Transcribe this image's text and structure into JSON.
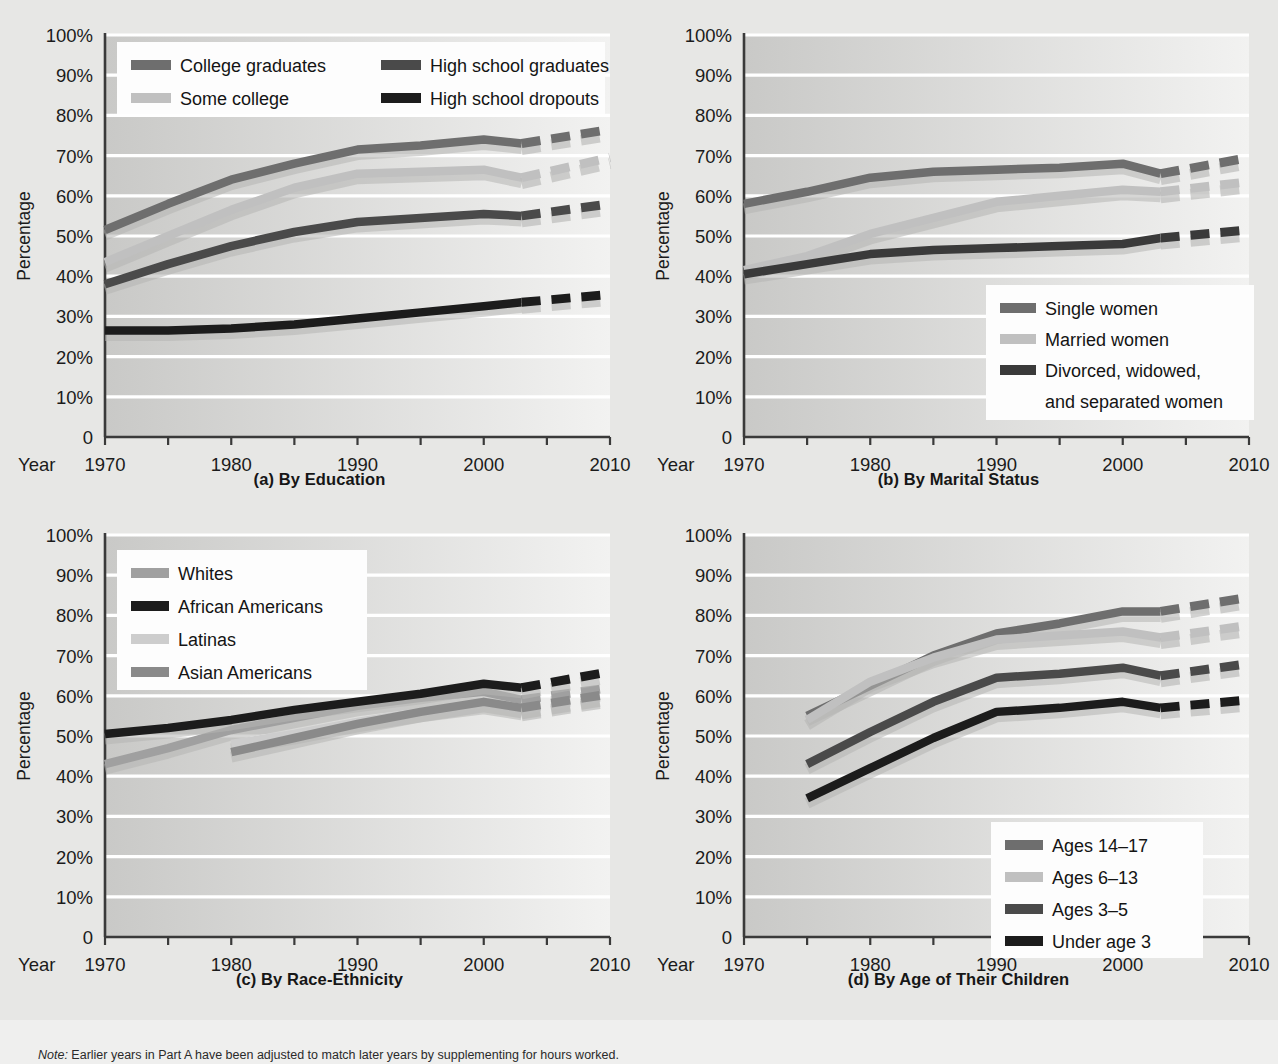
{
  "figure": {
    "note_prefix": "Note:",
    "note_text": " Earlier years in Part A have been adjusted to match later years by supplementing for hours worked.",
    "background_color": "#e7e7e5",
    "plot_fill_left": "#c9c9c7",
    "plot_fill_right": "#f2f2f1",
    "gridline_color": "#ffffff",
    "axis_color": "#3a3a3a"
  },
  "axes_common": {
    "ylabel": "Percentage",
    "year_label": "Year",
    "y_ticks": [
      "100%",
      "90%",
      "80%",
      "70%",
      "60%",
      "50%",
      "40%",
      "30%",
      "20%",
      "10%",
      "0"
    ],
    "y_values": [
      100,
      90,
      80,
      70,
      60,
      50,
      40,
      30,
      20,
      10,
      0
    ],
    "x_ticks": [
      "1970",
      "1980",
      "1990",
      "2000",
      "2010"
    ],
    "x_tick_values": [
      1970,
      1980,
      1990,
      2000,
      2010
    ],
    "x_minor_step": 5,
    "xlim": [
      1970,
      2010
    ],
    "ylim": [
      0,
      100
    ],
    "grid": true
  },
  "series_colors": {
    "dark_gray": "#6e6e6e",
    "light_gray": "#c0c0c0",
    "darker_gray": "#4a4a4a",
    "black": "#1c1c1c",
    "mid_gray": "#8a8a8a",
    "pale_gray": "#cdcdcd"
  },
  "chart_data": [
    {
      "id": "a",
      "type": "line",
      "title": "(a) By Education",
      "xlabel": "Year",
      "ylabel": "Percentage",
      "xlim": [
        1970,
        2010
      ],
      "ylim": [
        0,
        100
      ],
      "grid": true,
      "legend_position": "top-left",
      "projection_start_year": 2003,
      "series": [
        {
          "name": "College graduates",
          "color": "#6e6e6e",
          "x": [
            1970,
            1975,
            1980,
            1985,
            1990,
            1995,
            2000,
            2003
          ],
          "values": [
            51.5,
            58.0,
            64.0,
            68.0,
            71.5,
            72.5,
            74.0,
            73.0
          ],
          "projection_x": [
            2003,
            2010
          ],
          "projection_values": [
            73.0,
            76.5
          ]
        },
        {
          "name": "Some college",
          "color": "#c0c0c0",
          "x": [
            1970,
            1975,
            1980,
            1985,
            1990,
            1995,
            2000,
            2003
          ],
          "values": [
            43.5,
            50.0,
            56.5,
            62.0,
            65.5,
            66.0,
            66.5,
            64.5
          ],
          "projection_x": [
            2003,
            2010
          ],
          "projection_values": [
            64.5,
            69.5
          ]
        },
        {
          "name": "High school graduates",
          "color": "#4a4a4a",
          "x": [
            1970,
            1975,
            1980,
            1985,
            1990,
            1995,
            2000,
            2003
          ],
          "values": [
            38.0,
            43.0,
            47.5,
            51.0,
            53.5,
            54.5,
            55.5,
            55.0
          ],
          "projection_x": [
            2003,
            2010
          ],
          "projection_values": [
            55.0,
            58.0
          ]
        },
        {
          "name": "High school dropouts",
          "color": "#1c1c1c",
          "x": [
            1970,
            1975,
            1980,
            1985,
            1990,
            1995,
            2000,
            2003
          ],
          "values": [
            26.5,
            26.5,
            27.0,
            28.0,
            29.5,
            31.0,
            32.5,
            33.5
          ],
          "projection_x": [
            2003,
            2010
          ],
          "projection_values": [
            33.5,
            35.5
          ]
        }
      ],
      "legend": [
        {
          "label": "College graduates",
          "color": "#6e6e6e"
        },
        {
          "label": "High school graduates",
          "color": "#4a4a4a"
        },
        {
          "label": "Some college",
          "color": "#c0c0c0"
        },
        {
          "label": "High school dropouts",
          "color": "#1c1c1c"
        }
      ]
    },
    {
      "id": "b",
      "type": "line",
      "title": "(b) By Marital Status",
      "xlabel": "Year",
      "ylabel": "Percentage",
      "xlim": [
        1970,
        2010
      ],
      "ylim": [
        0,
        100
      ],
      "grid": true,
      "legend_position": "bottom-right",
      "projection_start_year": 2003,
      "series": [
        {
          "name": "Single women",
          "color": "#6e6e6e",
          "x": [
            1970,
            1975,
            1980,
            1985,
            1990,
            1995,
            2000,
            2003
          ],
          "values": [
            58.0,
            61.0,
            64.5,
            66.0,
            66.5,
            67.0,
            68.0,
            65.5
          ],
          "projection_x": [
            2003,
            2010
          ],
          "projection_values": [
            65.5,
            69.5
          ]
        },
        {
          "name": "Married women",
          "color": "#c0c0c0",
          "x": [
            1970,
            1975,
            1980,
            1985,
            1990,
            1995,
            2000,
            2003
          ],
          "values": [
            41.5,
            45.0,
            50.5,
            54.5,
            58.5,
            60.0,
            61.5,
            61.0
          ],
          "projection_x": [
            2003,
            2010
          ],
          "projection_values": [
            61.0,
            63.5
          ]
        },
        {
          "name": "Divorced, widowed, and separated women",
          "color": "#3a3a3a",
          "x": [
            1970,
            1975,
            1980,
            1985,
            1990,
            1995,
            2000,
            2003
          ],
          "values": [
            40.5,
            43.0,
            45.5,
            46.5,
            47.0,
            47.5,
            48.0,
            49.5
          ],
          "projection_x": [
            2003,
            2010
          ],
          "projection_values": [
            49.5,
            51.5
          ]
        }
      ],
      "legend": [
        {
          "label": "Single women",
          "color": "#6e6e6e"
        },
        {
          "label": "Married women",
          "color": "#c0c0c0"
        },
        {
          "label": "Divorced, widowed,",
          "color": "#3a3a3a"
        },
        {
          "label": "and separated women",
          "color": null
        }
      ]
    },
    {
      "id": "c",
      "type": "line",
      "title": "(c) By Race-Ethnicity",
      "xlabel": "Year",
      "ylabel": "Percentage",
      "xlim": [
        1970,
        2010
      ],
      "ylim": [
        0,
        100
      ],
      "grid": true,
      "legend_position": "top-left",
      "projection_start_year": 2003,
      "series": [
        {
          "name": "Whites",
          "color": "#a0a0a0",
          "x": [
            1970,
            1975,
            1980,
            1985,
            1990,
            1995,
            2000,
            2003
          ],
          "values": [
            43.0,
            47.0,
            51.5,
            54.5,
            57.5,
            59.5,
            61.0,
            59.0
          ],
          "projection_x": [
            2003,
            2010
          ],
          "projection_values": [
            59.0,
            62.0
          ]
        },
        {
          "name": "African Americans",
          "color": "#1c1c1c",
          "x": [
            1970,
            1975,
            1980,
            1985,
            1990,
            1995,
            2000,
            2003
          ],
          "values": [
            50.5,
            52.0,
            54.0,
            56.5,
            58.5,
            60.5,
            63.0,
            62.0
          ],
          "projection_x": [
            2003,
            2010
          ],
          "projection_values": [
            62.0,
            66.0
          ]
        },
        {
          "name": "Latinas",
          "color": "#cdcdcd",
          "x": [
            1980,
            1985,
            1990,
            1995,
            2000,
            2003
          ],
          "values": [
            48.0,
            50.5,
            53.5,
            56.0,
            58.0,
            56.5
          ],
          "projection_x": [
            2003,
            2010
          ],
          "projection_values": [
            56.5,
            60.0
          ]
        },
        {
          "name": "Asian Americans",
          "color": "#8a8a8a",
          "x": [
            1980,
            1985,
            1990,
            1995,
            2000,
            2003
          ],
          "values": [
            46.0,
            49.5,
            53.0,
            56.0,
            58.5,
            57.0
          ],
          "projection_x": [
            2003,
            2010
          ],
          "projection_values": [
            57.0,
            60.5
          ]
        }
      ],
      "legend": [
        {
          "label": "Whites",
          "color": "#a0a0a0"
        },
        {
          "label": "African Americans",
          "color": "#1c1c1c"
        },
        {
          "label": "Latinas",
          "color": "#cdcdcd"
        },
        {
          "label": "Asian Americans",
          "color": "#8a8a8a"
        }
      ]
    },
    {
      "id": "d",
      "type": "line",
      "title": "(d) By Age of Their Children",
      "xlabel": "Year",
      "ylabel": "Percentage",
      "xlim": [
        1970,
        2010
      ],
      "ylim": [
        0,
        100
      ],
      "grid": true,
      "legend_position": "bottom-right",
      "projection_start_year": 2003,
      "series": [
        {
          "name": "Ages 14-17",
          "color": "#6e6e6e",
          "x": [
            1975,
            1980,
            1985,
            1990,
            1995,
            2000,
            2003
          ],
          "values": [
            55.0,
            62.5,
            70.0,
            75.5,
            78.0,
            81.0,
            81.0
          ],
          "projection_x": [
            2003,
            2010
          ],
          "projection_values": [
            81.0,
            84.5
          ]
        },
        {
          "name": "Ages 6-13",
          "color": "#c0c0c0",
          "x": [
            1975,
            1980,
            1985,
            1990,
            1995,
            2000,
            2003
          ],
          "values": [
            54.0,
            63.5,
            69.5,
            74.0,
            75.0,
            76.0,
            74.5
          ],
          "projection_x": [
            2003,
            2010
          ],
          "projection_values": [
            74.5,
            77.5
          ]
        },
        {
          "name": "Ages 3-5",
          "color": "#4a4a4a",
          "x": [
            1975,
            1980,
            1985,
            1990,
            1995,
            2000,
            2003
          ],
          "values": [
            43.0,
            51.0,
            58.5,
            64.5,
            65.5,
            67.0,
            65.0
          ],
          "projection_x": [
            2003,
            2010
          ],
          "projection_values": [
            65.0,
            68.0
          ]
        },
        {
          "name": "Under age 3",
          "color": "#1c1c1c",
          "x": [
            1975,
            1980,
            1985,
            1990,
            1995,
            2000,
            2003
          ],
          "values": [
            34.5,
            42.0,
            49.5,
            56.0,
            57.0,
            58.5,
            57.0
          ],
          "projection_x": [
            2003,
            2010
          ],
          "projection_values": [
            57.0,
            59.0
          ]
        }
      ],
      "legend": [
        {
          "label": "Ages 14–17",
          "color": "#6e6e6e"
        },
        {
          "label": "Ages 6–13",
          "color": "#c0c0c0"
        },
        {
          "label": "Ages 3–5",
          "color": "#4a4a4a"
        },
        {
          "label": "Under age 3",
          "color": "#1c1c1c"
        }
      ]
    }
  ]
}
